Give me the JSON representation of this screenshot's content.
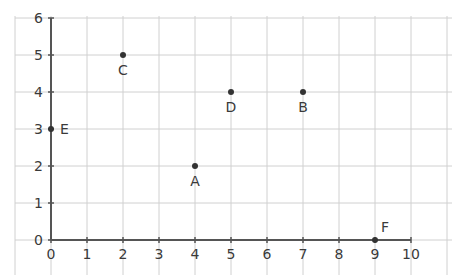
{
  "chart_data": {
    "type": "scatter",
    "title": "",
    "xlabel": "",
    "ylabel": "",
    "xlim": [
      0,
      10
    ],
    "ylim": [
      0,
      6
    ],
    "grid": true,
    "x_ticks": [
      "0",
      "1",
      "2",
      "3",
      "4",
      "5",
      "6",
      "7",
      "8",
      "9",
      "10"
    ],
    "y_ticks": [
      "0",
      "1",
      "2",
      "3",
      "4",
      "5",
      "6"
    ],
    "points": [
      {
        "label": "A",
        "x": 4,
        "y": 2
      },
      {
        "label": "B",
        "x": 7,
        "y": 4
      },
      {
        "label": "C",
        "x": 2,
        "y": 5
      },
      {
        "label": "D",
        "x": 5,
        "y": 4
      },
      {
        "label": "E",
        "x": 0,
        "y": 3
      },
      {
        "label": "F",
        "x": 9,
        "y": 0
      }
    ]
  },
  "colors": {
    "grid": "#d0d0d0",
    "axis": "#555555",
    "point": "#333333",
    "text": "#3a3a3a"
  }
}
